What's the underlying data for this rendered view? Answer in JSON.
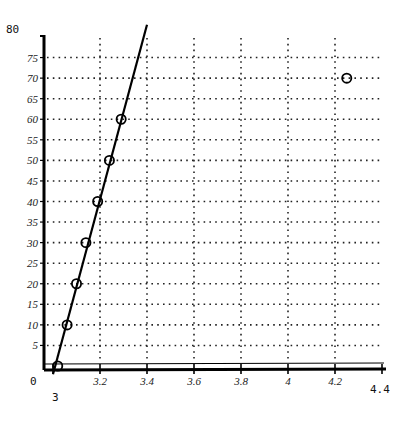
{
  "chart_data": {
    "type": "scatter",
    "title": "",
    "xlabel": "",
    "ylabel": "",
    "xlim": [
      3,
      4.4
    ],
    "ylim": [
      0,
      80
    ],
    "grid": true,
    "x_ticks": [
      "3",
      "3.2",
      "3.4",
      "3.6",
      "3.8",
      "4",
      "4.2",
      "4.4"
    ],
    "y_ticks": [
      "0",
      "5",
      "10",
      "15",
      "20",
      "25",
      "30",
      "35",
      "40",
      "45",
      "50",
      "55",
      "60",
      "65",
      "70",
      "75",
      "80"
    ],
    "series": [
      {
        "name": "points",
        "marker": "circle-open",
        "points": [
          {
            "x": 3.02,
            "y": 0
          },
          {
            "x": 3.06,
            "y": 10
          },
          {
            "x": 3.1,
            "y": 20
          },
          {
            "x": 3.14,
            "y": 30
          },
          {
            "x": 3.19,
            "y": 40
          },
          {
            "x": 3.24,
            "y": 50
          },
          {
            "x": 3.29,
            "y": 60
          },
          {
            "x": 4.25,
            "y": 70
          }
        ]
      },
      {
        "name": "fit-line",
        "type": "line",
        "points": [
          {
            "x": 3.0,
            "y": -2
          },
          {
            "x": 3.4,
            "y": 83
          }
        ]
      }
    ]
  },
  "axis": {
    "y_top_label": "80",
    "x_origin_label": "0",
    "x_start_label": "3",
    "x_end_label": "4.4"
  }
}
